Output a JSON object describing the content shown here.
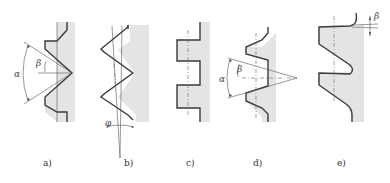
{
  "figure": {
    "panels": [
      {
        "id": "a",
        "label": "a)",
        "profile": "triangular",
        "symbols": [
          "α",
          "β"
        ]
      },
      {
        "id": "b",
        "label": "b)",
        "profile": "triangular-helix",
        "symbols": [
          "φ"
        ]
      },
      {
        "id": "c",
        "label": "c)",
        "profile": "rectangular",
        "symbols": []
      },
      {
        "id": "d",
        "label": "d)",
        "profile": "trapezoidal",
        "symbols": [
          "α",
          "β"
        ]
      },
      {
        "id": "e",
        "label": "e)",
        "profile": "buttress",
        "symbols": [
          "β"
        ]
      }
    ],
    "symbols": {
      "alpha": "α",
      "beta": "β",
      "phi": "φ"
    },
    "colors": {
      "stroke": "#3a3a3a",
      "shade": "#e4e4e4",
      "background": "#ffffff"
    }
  }
}
